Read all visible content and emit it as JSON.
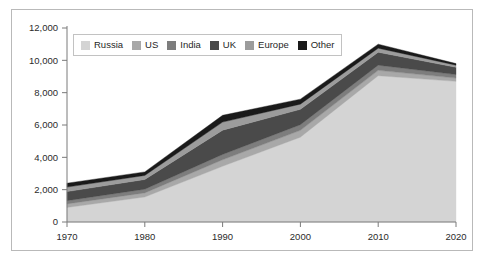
{
  "chart_data": {
    "type": "area",
    "stacked": true,
    "title": "",
    "xlabel": "",
    "ylabel": "",
    "x": [
      1970,
      1980,
      1990,
      2000,
      2010,
      2020
    ],
    "categories": [
      "1970",
      "1980",
      "1990",
      "2000",
      "2010",
      "2020"
    ],
    "xtick_labels": [
      "1970",
      "1980",
      "1990",
      "2000",
      "2010",
      "2020"
    ],
    "ytick_labels": [
      "0",
      "2,000",
      "4,000",
      "6,000",
      "8,000",
      "10,000",
      "12,000"
    ],
    "ytick_values": [
      0,
      2000,
      4000,
      6000,
      8000,
      10000,
      12000
    ],
    "ylim": [
      0,
      12000
    ],
    "xlim": [
      1970,
      2020
    ],
    "grid": false,
    "legend_position": "top-left-inside",
    "series": [
      {
        "name": "Russia",
        "color": "#d4d4d4",
        "values": [
          900,
          1550,
          3450,
          5250,
          9050,
          8700
        ]
      },
      {
        "name": "US",
        "color": "#a8a8a8",
        "values": [
          220,
          250,
          400,
          420,
          330,
          200
        ]
      },
      {
        "name": "India",
        "color": "#7d7d7d",
        "values": [
          200,
          230,
          330,
          350,
          320,
          220
        ]
      },
      {
        "name": "UK",
        "color": "#4a4a4a",
        "values": [
          560,
          600,
          1500,
          950,
          800,
          450
        ]
      },
      {
        "name": "Europe",
        "color": "#9c9c9c",
        "values": [
          280,
          250,
          500,
          320,
          250,
          130
        ]
      },
      {
        "name": "Other",
        "color": "#1a1a1a",
        "values": [
          240,
          220,
          420,
          310,
          250,
          100
        ]
      }
    ],
    "totals": [
      2400,
      3100,
      6600,
      7600,
      11000,
      9800
    ]
  },
  "legend": {
    "items": [
      {
        "label": "Russia"
      },
      {
        "label": "US"
      },
      {
        "label": "India"
      },
      {
        "label": "UK"
      },
      {
        "label": "Europe"
      },
      {
        "label": "Other"
      }
    ]
  },
  "colors": {
    "frame_border": "#b9b9b9",
    "axis": "#7a7a7a",
    "background": "#ffffff",
    "text": "#2b2b2b"
  }
}
